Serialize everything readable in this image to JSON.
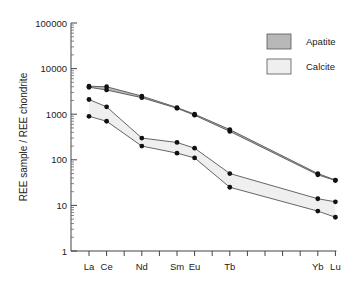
{
  "chart_data": {
    "type": "line",
    "title": "",
    "xlabel": "",
    "ylabel": "REE sample / REE chondrite",
    "yscale": "log",
    "ylim": [
      1,
      100000
    ],
    "y_ticks": [
      "1",
      "10",
      "100",
      "1000",
      "10000",
      "100000"
    ],
    "x_ticks_all": [
      "La",
      "Ce",
      "Pr",
      "Nd",
      "Pm",
      "Sm",
      "Eu",
      "Gd",
      "Tb",
      "Dy",
      "Ho",
      "Er",
      "Tm",
      "Yb",
      "Lu"
    ],
    "x_tick_labels": [
      "La",
      "Ce",
      "Nd",
      "Sm",
      "Eu",
      "Tb",
      "Yb",
      "Lu"
    ],
    "categories": [
      "La",
      "Ce",
      "Nd",
      "Sm",
      "Eu",
      "Tb",
      "Yb",
      "Lu"
    ],
    "grid": false,
    "legend_position": "upper right",
    "legend": [
      {
        "label": "Apatite",
        "fill": "#b8b8b8"
      },
      {
        "label": "Calcite",
        "fill": "#efefef"
      }
    ],
    "series": [
      {
        "name": "Apatite (upper)",
        "band": "Apatite",
        "values": [
          4100,
          4000,
          2500,
          1400,
          1000,
          460,
          50,
          36
        ]
      },
      {
        "name": "Apatite (lower)",
        "band": "Apatite",
        "values": [
          3900,
          3400,
          2300,
          1350,
          950,
          420,
          47,
          35
        ]
      },
      {
        "name": "Calcite (upper)",
        "band": "Calcite",
        "values": [
          2100,
          1450,
          300,
          240,
          180,
          50,
          14,
          12
        ]
      },
      {
        "name": "Calcite (lower)",
        "band": "Calcite",
        "values": [
          900,
          700,
          200,
          140,
          110,
          25,
          7.5,
          5.5
        ]
      }
    ]
  }
}
